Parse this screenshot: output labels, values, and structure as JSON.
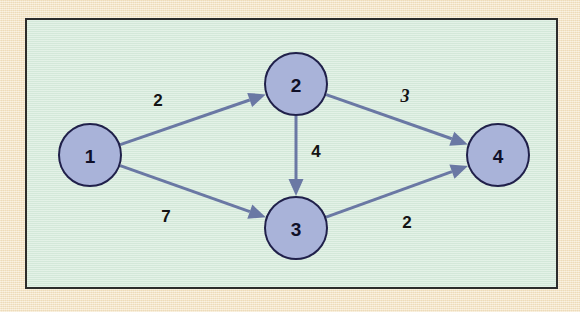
{
  "figure": {
    "frame_border_color": "#2c2c2c",
    "panel_color": "#d8ecdd",
    "mat_color": "#f6e6c6",
    "node_fill_color": "#a9b3d9",
    "node_stroke_color": "#20204a",
    "edge_color": "#6a78a4",
    "label_color": "#131313"
  },
  "graph_data": {
    "type": "directed-weighted-graph",
    "nodes": [
      {
        "id": "1",
        "label": "1",
        "cx": 90,
        "cy": 155,
        "r": 31
      },
      {
        "id": "2",
        "label": "2",
        "cx": 296,
        "cy": 84,
        "r": 31
      },
      {
        "id": "3",
        "label": "3",
        "cx": 296,
        "cy": 228,
        "r": 31
      },
      {
        "id": "4",
        "label": "4",
        "cx": 498,
        "cy": 155,
        "r": 31
      }
    ],
    "edges": [
      {
        "from": "1",
        "to": "2",
        "weight": "2",
        "label_x": 158,
        "label_y": 100,
        "italic": false
      },
      {
        "from": "1",
        "to": "3",
        "weight": "7",
        "label_x": 166,
        "label_y": 216,
        "italic": false
      },
      {
        "from": "2",
        "to": "3",
        "weight": "4",
        "label_x": 316,
        "label_y": 151,
        "italic": false
      },
      {
        "from": "2",
        "to": "4",
        "weight": "3",
        "label_x": 405,
        "label_y": 96,
        "italic": true
      },
      {
        "from": "3",
        "to": "4",
        "weight": "2",
        "label_x": 407,
        "label_y": 222,
        "italic": false
      }
    ]
  }
}
